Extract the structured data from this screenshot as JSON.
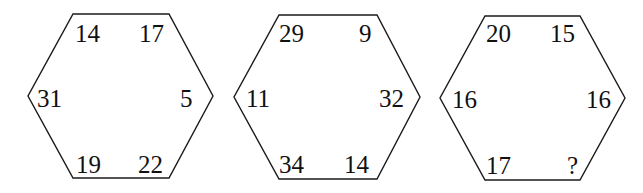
{
  "puzzle": {
    "description": "Three hexagons each with six numbers at their vertices; the last contains an unknown value",
    "hexagons": [
      {
        "top_left": "14",
        "top_right": "17",
        "right": "5",
        "bottom_right": "22",
        "bottom_left": "19",
        "left": "31"
      },
      {
        "top_left": "29",
        "top_right": "9",
        "right": "32",
        "bottom_right": "14",
        "bottom_left": "34",
        "left": "11"
      },
      {
        "top_left": "20",
        "top_right": "15",
        "right": "16",
        "bottom_right": "?",
        "bottom_left": "17",
        "left": "16"
      }
    ]
  },
  "colors": {
    "stroke": "#1a1a1a",
    "text": "#111111",
    "background": "#ffffff"
  }
}
